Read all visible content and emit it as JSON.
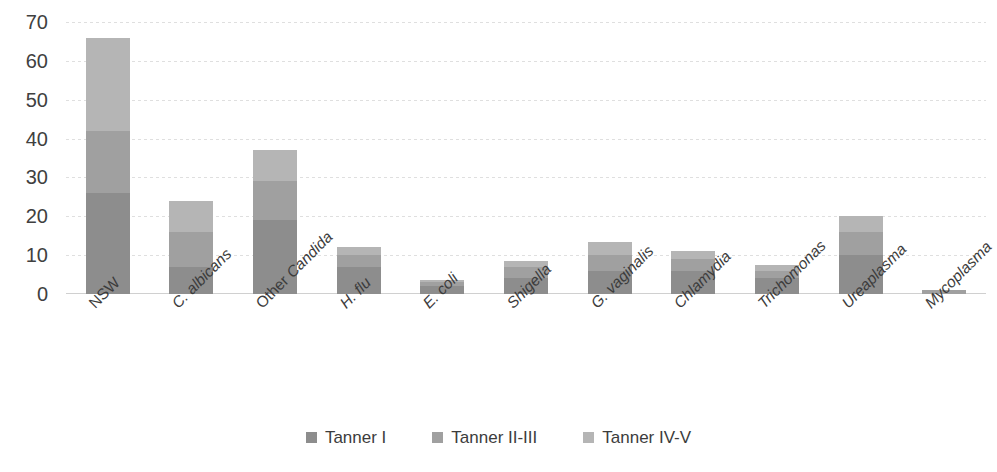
{
  "chart_data": {
    "type": "bar",
    "stacked": true,
    "title": "",
    "xlabel": "",
    "ylabel": "",
    "ylim": [
      0,
      70
    ],
    "yticks": [
      0,
      10,
      20,
      30,
      40,
      50,
      60,
      70
    ],
    "grid": true,
    "legend_position": "bottom",
    "categories": [
      "NSW",
      "C. albicans",
      "Other Candida",
      "H. flu",
      "E. coli",
      "Shigella",
      "G. vaginalis",
      "Chlamydia",
      "Trichomonas",
      "Ureaplasma",
      "Mycoplasma"
    ],
    "category_styles": [
      "plain",
      "italic",
      "mixed",
      "italic",
      "italic",
      "italic",
      "italic",
      "italic",
      "italic",
      "italic",
      "italic"
    ],
    "series": [
      {
        "name": "Tanner I",
        "color": "#8d8d8d",
        "values": [
          26,
          7,
          19,
          7,
          2,
          4,
          6,
          6,
          4,
          10,
          0
        ]
      },
      {
        "name": "Tanner II-III",
        "color": "#a0a0a0",
        "values": [
          16,
          9,
          10,
          3,
          1,
          3,
          4,
          3,
          2,
          6,
          1
        ]
      },
      {
        "name": "Tanner IV-V",
        "color": "#b5b5b5",
        "values": [
          24,
          8,
          8,
          2,
          0.5,
          1.5,
          3.5,
          2,
          1.5,
          4,
          0
        ]
      }
    ],
    "totals": [
      66,
      24,
      37,
      12,
      3.5,
      8.5,
      13.5,
      11,
      7.5,
      20,
      1
    ]
  }
}
